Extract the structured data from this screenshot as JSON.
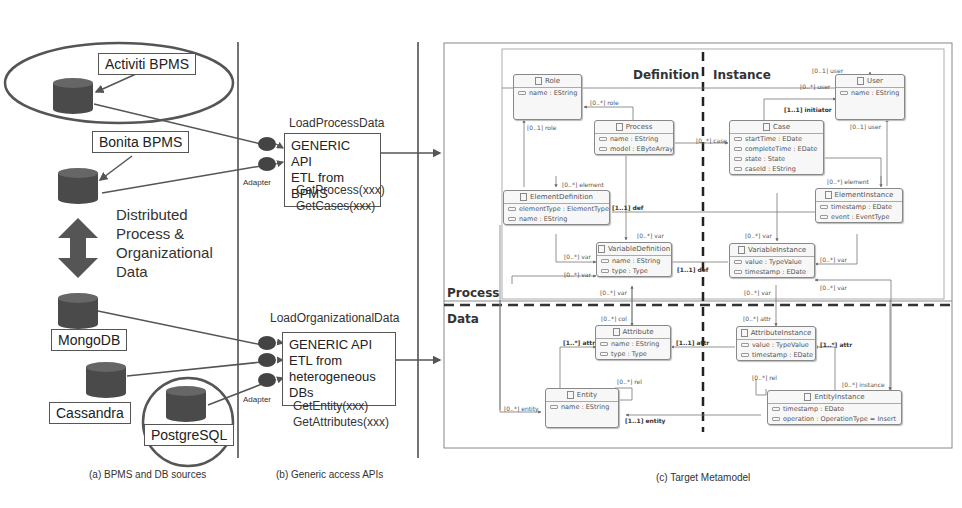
{
  "panel_a": {
    "sources": {
      "activiti": "Activiti BPMS",
      "bonita": "Bonita BPMS",
      "mongodb": "MongoDB",
      "cassandra": "Cassandra",
      "postgresql": "PostgreSQL"
    },
    "distributed_label": [
      "Distributed",
      "Process &",
      "Organizational",
      "Data"
    ],
    "caption": "(a) BPMS and DB sources"
  },
  "panel_b": {
    "process_api": {
      "title": "LoadProcessData",
      "line1": "GENERIC API",
      "line2": "ETL from BPMS",
      "methods": [
        "GetProcess(xxx)",
        "GetCases(xxx)"
      ]
    },
    "org_api": {
      "title": "LoadOrganizationalData",
      "line1": "GENERIC API",
      "line2": "ETL from",
      "line3": "heterogeneous DBs",
      "methods": [
        "GetEntity(xxx)",
        "GetAttributes(xxx)"
      ]
    },
    "adapter_label": "Adapter",
    "caption": "(b) Generic access APIs"
  },
  "panel_c": {
    "sections": {
      "definition": "Definition",
      "instance": "Instance",
      "process": "Process",
      "data": "Data"
    },
    "classes": {
      "role": {
        "name": "Role",
        "attrs": [
          "name : EString"
        ]
      },
      "process": {
        "name": "Process",
        "attrs": [
          "name : EString",
          "model : EByteArray"
        ]
      },
      "user": {
        "name": "User",
        "attrs": [
          "name : EString"
        ]
      },
      "case": {
        "name": "Case",
        "attrs": [
          "startTime : EDate",
          "completeTime : EDate",
          "state : State",
          "caseId : EString"
        ]
      },
      "element_definition": {
        "name": "ElementDefinition",
        "attrs": [
          "elementType : ElementType",
          "name : EString"
        ]
      },
      "element_instance": {
        "name": "ElementInstance",
        "attrs": [
          "timestamp : EDate",
          "event : EventType"
        ]
      },
      "variable_definition": {
        "name": "VariableDefinition",
        "attrs": [
          "name : EString",
          "type : Type"
        ]
      },
      "variable_instance": {
        "name": "VariableInstance",
        "attrs": [
          "value : TypeValue",
          "timestamp : EDate"
        ]
      },
      "attribute": {
        "name": "Attribute",
        "attrs": [
          "name : EString",
          "type : Type"
        ]
      },
      "attribute_instance": {
        "name": "AttributeInstance",
        "attrs": [
          "value : TypeValue",
          "timestamp : EDate"
        ]
      },
      "entity": {
        "name": "Entity",
        "attrs": [
          "name : EString"
        ]
      },
      "entity_instance": {
        "name": "EntityInstance",
        "attrs": [
          "timestamp : EDate",
          "operation : OperationType = Insert"
        ]
      }
    },
    "relations": {
      "role_top": "[0..*] role",
      "role_left": "[0..1] role",
      "case": "[0..*] case",
      "user_top": "[0..1] user",
      "user_many": "[0..*] user",
      "initiator": "[1..1] initiator",
      "user_right": "[0..1] user",
      "element_def": "[0..*] element",
      "element_inst": "[0..*] element",
      "def_top": "[1..1] def",
      "def_bottom": "[1..1] def",
      "var_vd_top": "[0..*] var",
      "var_ed": "[0..*] var",
      "var_left": "[0..*] var",
      "var_bottom": "[0..*] var",
      "var_vi_top": "[0..*] var",
      "var_ei": "[0..*] var",
      "var_vi_right": "[0..*] var",
      "var_vi_bottom": "[0..*] var",
      "col": "[0..*] col",
      "attr_entity": "[1..*] attr",
      "attr_def": "[1..1] attr",
      "attr_inst": "[0..*] attr",
      "attr_ei": "[1..*] attr",
      "rel_entity": "[0..*] rel",
      "rel_ai": "[0..*] rel",
      "entity_left": "[0..*] entity",
      "entity_def": "[1..1] entity",
      "instance": "[0..*] instance"
    },
    "caption": "(c) Target Metamodel"
  }
}
